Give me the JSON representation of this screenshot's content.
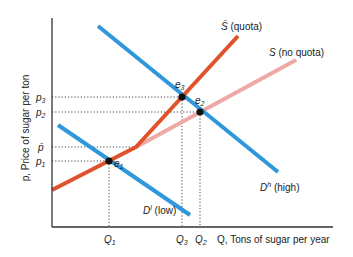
{
  "diagram": {
    "y_axis_label": "p, Price of sugar per ton",
    "x_axis_label": "Q, Tons of sugar per year",
    "price_labels": {
      "p3": {
        "base": "p",
        "sub": "3"
      },
      "p2": {
        "base": "p",
        "sub": "2"
      },
      "pbar": {
        "base": "p̄",
        "sub": ""
      },
      "p1": {
        "base": "p",
        "sub": "1"
      }
    },
    "quantity_labels": {
      "Q1": {
        "base": "Q",
        "sub": "1"
      },
      "Q3": {
        "base": "Q",
        "sub": "3"
      },
      "Q2": {
        "base": "Q",
        "sub": "2"
      }
    },
    "curves": {
      "supply_quota": {
        "base": "S̄",
        "suffix": " (quota)",
        "color": "#e0522a"
      },
      "supply_no_quota": {
        "base": "S",
        "suffix": " (no quota)",
        "color": "#efa9a5"
      },
      "demand_high": {
        "base": "D",
        "sup": "h",
        "suffix": " (high)",
        "color": "#2f97db"
      },
      "demand_low": {
        "base": "D",
        "sup": "l",
        "suffix": " (low)",
        "color": "#2f97db"
      }
    },
    "equilibria": {
      "e1": {
        "base": "e",
        "sub": "1"
      },
      "e2": {
        "base": "e",
        "sub": "2"
      },
      "e3": {
        "base": "e",
        "sub": "3"
      }
    }
  }
}
